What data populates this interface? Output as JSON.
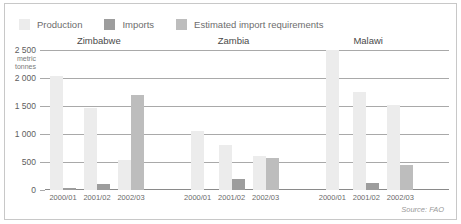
{
  "chart_data": {
    "type": "bar",
    "title": "",
    "xlabel": "",
    "ylabel": "metric tonnes",
    "ylim": [
      0,
      2500
    ],
    "yticks": [
      0,
      500,
      1000,
      1500,
      2000,
      2500
    ],
    "ytick_labels": [
      "0",
      "500",
      "1 000",
      "1 500",
      "2 000",
      "2 500"
    ],
    "grid": true,
    "legend_position": "top-left",
    "groups": [
      "Zimbabwe",
      "Zambia",
      "Malawi"
    ],
    "categories": [
      "2000/01",
      "2001/02",
      "2002/03"
    ],
    "series": [
      {
        "name": "Production",
        "color": "#ececec",
        "values": {
          "Zimbabwe": [
            2030,
            1470,
            540
          ],
          "Zambia": [
            1050,
            800,
            600
          ],
          "Malawi": [
            2560,
            1750,
            1510
          ]
        }
      },
      {
        "name": "Imports",
        "color": "#9d9d9d",
        "values": {
          "Zimbabwe": [
            40,
            110,
            null
          ],
          "Zambia": [
            null,
            200,
            null
          ],
          "Malawi": [
            null,
            130,
            null
          ]
        }
      },
      {
        "name": "Estimated import requirements",
        "color": "#bdbdbd",
        "values": {
          "Zimbabwe": [
            null,
            null,
            1700
          ],
          "Zambia": [
            null,
            null,
            580
          ],
          "Malawi": [
            null,
            null,
            450
          ]
        }
      }
    ],
    "annotations": [],
    "source": "Source: FAO"
  },
  "legend": {
    "items": [
      {
        "label": "Production",
        "color": "#ececec"
      },
      {
        "label": "Imports",
        "color": "#9d9d9d"
      },
      {
        "label": "Estimated import requirements",
        "color": "#bdbdbd"
      }
    ]
  },
  "axis": {
    "unit_line1": "metric",
    "unit_line2": "tonnes"
  },
  "footer": {
    "source": "Source: FAO"
  },
  "colors": {
    "frame": "#c8c8c8",
    "gridline": "#a9a9a9",
    "text": "#6d6d6d",
    "background": "#ffffff"
  }
}
